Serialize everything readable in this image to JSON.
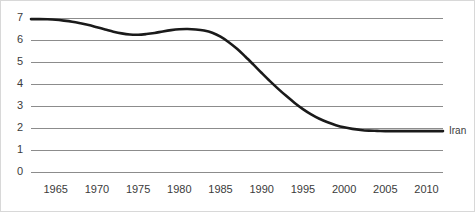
{
  "chart_data": {
    "type": "line",
    "title": "",
    "subtitle": "",
    "xlabel": "",
    "ylabel": "",
    "xlim": [
      1962,
      2012
    ],
    "ylim": [
      0,
      7
    ],
    "grid": true,
    "grid_axis": "y",
    "legend_position": "right-inline",
    "line_color": "#1a1a1a",
    "grid_color": "#8c8c8c",
    "background_color": "#ffffff",
    "y_ticks": [
      7,
      6,
      5,
      4,
      3,
      2,
      1,
      0
    ],
    "y_tick_labels": [
      "7",
      "6",
      "5",
      "4",
      "3",
      "2",
      "1",
      "0"
    ],
    "x_ticks": [
      1965,
      1970,
      1975,
      1980,
      1985,
      1990,
      1995,
      2000,
      2005,
      2010
    ],
    "x_tick_labels": [
      "1965",
      "1970",
      "1975",
      "1980",
      "1985",
      "1990",
      "1995",
      "2000",
      "2005",
      "2010"
    ],
    "series": [
      {
        "name": "Iran",
        "inline_label": "Iran",
        "color": "#1a1a1a",
        "x": [
          1962,
          1963,
          1964,
          1965,
          1966,
          1967,
          1968,
          1969,
          1970,
          1971,
          1972,
          1973,
          1974,
          1975,
          1976,
          1977,
          1978,
          1979,
          1980,
          1981,
          1982,
          1983,
          1984,
          1985,
          1986,
          1987,
          1988,
          1989,
          1990,
          1991,
          1992,
          1993,
          1994,
          1995,
          1996,
          1997,
          1998,
          1999,
          2000,
          2001,
          2002,
          2003,
          2004,
          2005,
          2006,
          2007,
          2008,
          2009,
          2010,
          2011,
          2012
        ],
        "values": [
          6.95,
          6.95,
          6.94,
          6.92,
          6.88,
          6.83,
          6.76,
          6.68,
          6.58,
          6.48,
          6.38,
          6.3,
          6.25,
          6.24,
          6.27,
          6.32,
          6.39,
          6.45,
          6.49,
          6.5,
          6.48,
          6.43,
          6.33,
          6.15,
          5.9,
          5.6,
          5.25,
          4.88,
          4.5,
          4.13,
          3.78,
          3.45,
          3.14,
          2.86,
          2.62,
          2.42,
          2.26,
          2.13,
          2.03,
          1.96,
          1.91,
          1.88,
          1.87,
          1.86,
          1.86,
          1.86,
          1.86,
          1.86,
          1.86,
          1.86,
          1.86
        ]
      }
    ],
    "plot_geometry": {
      "left": 30,
      "right": 442,
      "top": 17,
      "bottom": 171
    }
  }
}
